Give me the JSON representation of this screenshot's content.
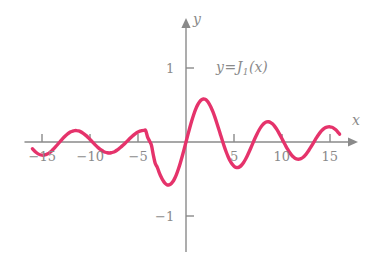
{
  "chart_data": {
    "type": "line",
    "title": "",
    "subtitle": "",
    "xlabel": "x",
    "ylabel": "y",
    "legend_entries": [
      "y=J1(x)"
    ],
    "annotation": {
      "text_lhs": "y",
      "text_op": "=",
      "text_fn": "J",
      "text_sub": "1",
      "text_arg": "(x)"
    },
    "grid": false,
    "legend_position": "inside-upper-right",
    "xlim": [
      -16.2,
      16.2
    ],
    "ylim": [
      -1.35,
      1.45
    ],
    "xticks": [
      -15,
      -10,
      -5,
      5,
      10,
      15
    ],
    "xtick_labels": [
      "-15",
      "-10",
      "-5",
      "5",
      "10",
      "15"
    ],
    "yticks": [
      1,
      -1
    ],
    "ytick_labels": [
      "1",
      "-1"
    ],
    "series": [
      {
        "name": "J1(x)",
        "color": "#e5336b",
        "linewidth": 3.4,
        "x": [
          -16.0,
          -15.8,
          -15.6,
          -15.4,
          -15.2,
          -15.0,
          -14.8,
          -14.6,
          -14.4,
          -14.2,
          -14.0,
          -13.8,
          -13.6,
          -13.4,
          -13.2,
          -13.0,
          -12.8,
          -12.6,
          -12.4,
          -12.2,
          -12.0,
          -11.8,
          -11.6,
          -11.4,
          -11.2,
          -11.0,
          -10.8,
          -10.6,
          -10.4,
          -10.2,
          -10.0,
          -9.8,
          -9.6,
          -9.4,
          -9.2,
          -9.0,
          -8.8,
          -8.6,
          -8.4,
          -8.2,
          -8.0,
          -7.8,
          -7.6,
          -7.4,
          -7.2,
          -7.0,
          -6.8,
          -6.6,
          -6.4,
          -6.2,
          -6.0,
          -5.8,
          -5.6,
          -5.4,
          -5.2,
          -5.0,
          -4.8,
          -4.6,
          -4.4,
          -4.2,
          -4.0,
          -3.8,
          -3.6,
          -3.4,
          -3.2,
          -3.0,
          -2.8,
          -2.6,
          -2.4,
          -2.2,
          -2.0,
          -1.8,
          -1.6,
          -1.4,
          -1.2,
          -1.0,
          -0.8,
          -0.6,
          -0.4,
          -0.2,
          0.0,
          0.2,
          0.4,
          0.6,
          0.8,
          1.0,
          1.2,
          1.4,
          1.6,
          1.8,
          2.0,
          2.2,
          2.4,
          2.6,
          2.8,
          3.0,
          3.2,
          3.4,
          3.6,
          3.8,
          4.0,
          4.2,
          4.4,
          4.6,
          4.8,
          5.0,
          5.2,
          5.4,
          5.6,
          5.8,
          6.0,
          6.2,
          6.4,
          6.6,
          6.8,
          7.0,
          7.2,
          7.4,
          7.6,
          7.8,
          8.0,
          8.2,
          8.4,
          8.6,
          8.8,
          9.0,
          9.2,
          9.4,
          9.6,
          9.8,
          10.0,
          10.2,
          10.4,
          10.6,
          10.8,
          11.0,
          11.2,
          11.4,
          11.6,
          11.8,
          12.0,
          12.2,
          12.4,
          12.6,
          12.8,
          13.0,
          13.2,
          13.4,
          13.6,
          13.8,
          14.0,
          14.2,
          14.4,
          14.6,
          14.8,
          15.0,
          15.2,
          15.4,
          15.6,
          15.8,
          16.0
        ],
        "y": [
          -0.0904,
          -0.1189,
          -0.1424,
          -0.1603,
          -0.1722,
          -0.178,
          -0.1776,
          -0.1711,
          -0.159,
          -0.1418,
          -0.1201,
          -0.0948,
          -0.0668,
          -0.0371,
          -0.0068,
          0.0233,
          0.0521,
          0.0787,
          0.1022,
          0.1219,
          0.1373,
          0.1479,
          0.1535,
          0.154,
          0.1493,
          0.1398,
          0.1257,
          0.1075,
          0.0859,
          0.0616,
          0.0355,
          0.0084,
          -0.0188,
          -0.0452,
          -0.07,
          -0.0923,
          -0.1116,
          -0.1272,
          -0.1386,
          -0.1456,
          -0.1478,
          -0.1454,
          -0.1384,
          -0.1271,
          -0.1118,
          -0.0931,
          -0.0717,
          -0.0483,
          -0.0236,
          0.0014,
          0.0277,
          0.0534,
          0.0779,
          0.1002,
          0.1197,
          0.1355,
          0.1473,
          0.1545,
          0.157,
          0.1545,
          0.066,
          0.0128,
          -0.0446,
          -0.1792,
          -0.2913,
          -0.3391,
          -0.4097,
          -0.4708,
          -0.5202,
          -0.556,
          -0.5767,
          -0.5815,
          -0.5699,
          -0.5419,
          -0.4983,
          -0.4401,
          -0.3688,
          -0.2867,
          -0.196,
          -0.0995,
          0.0,
          0.0995,
          0.196,
          0.2867,
          0.3688,
          0.4401,
          0.4983,
          0.5419,
          0.5699,
          0.5815,
          0.5767,
          0.556,
          0.5202,
          0.4708,
          0.4097,
          0.3391,
          0.2613,
          0.1792,
          0.0955,
          0.0128,
          -0.066,
          -0.1386,
          -0.2028,
          -0.2566,
          -0.2985,
          -0.3276,
          -0.3432,
          -0.3453,
          -0.3343,
          -0.311,
          -0.2767,
          -0.2329,
          -0.1816,
          -0.125,
          -0.0652,
          -0.0047,
          0.0543,
          0.1096,
          0.1592,
          0.2014,
          0.2346,
          0.258,
          0.2708,
          0.2728,
          0.2641,
          0.2453,
          0.2174,
          0.1816,
          0.1395,
          0.0928,
          0.0435,
          -0.0066,
          -0.0555,
          -0.1012,
          -0.1422,
          -0.1768,
          -0.2039,
          -0.2225,
          -0.232,
          -0.2323,
          -0.2234,
          -0.206,
          -0.1807,
          -0.1487,
          -0.1114,
          -0.0703,
          -0.0271,
          0.0166,
          0.0591,
          0.0988,
          0.1334,
          0.1622,
          0.184,
          0.1981,
          0.2041,
          0.2051,
          0.199,
          0.1852,
          0.1645,
          0.1378,
          0.1063
        ]
      }
    ],
    "style": {
      "axis_color": "#8a8a8a",
      "axis_width": 1.4,
      "tick_length": 8,
      "background": "#ffffff",
      "curve_color": "#e5336b"
    }
  },
  "axes": {
    "x_axis_name": "x",
    "y_axis_name": "y"
  },
  "tick_labels": {
    "x": [
      {
        "value": -15,
        "text": "−15"
      },
      {
        "value": -10,
        "text": "−10"
      },
      {
        "value": -5,
        "text": "−5"
      },
      {
        "value": 5,
        "text": "5"
      },
      {
        "value": 10,
        "text": "10"
      },
      {
        "value": 15,
        "text": "15"
      }
    ],
    "y": [
      {
        "value": 1,
        "text": "1"
      },
      {
        "value": -1,
        "text": "−1"
      }
    ]
  }
}
